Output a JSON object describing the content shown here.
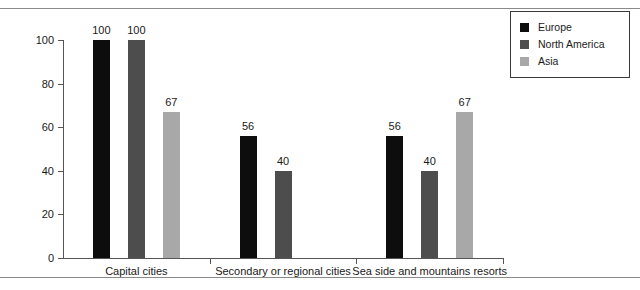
{
  "chart_data": {
    "type": "bar",
    "title": "",
    "subtitle": "",
    "xlabel": "",
    "ylabel": "",
    "ylim": [
      0,
      100
    ],
    "yticks": [
      0,
      20,
      40,
      60,
      80,
      100
    ],
    "grid": false,
    "legend_position": "top-right",
    "categories": [
      "Capital cities",
      "Secondary or regional cities",
      "Sea side and mountains resorts"
    ],
    "series": [
      {
        "name": "Europe",
        "color": "#0d0d0d",
        "values": [
          100,
          56,
          56
        ]
      },
      {
        "name": "North America",
        "color": "#4d4d4d",
        "values": [
          100,
          40,
          40
        ]
      },
      {
        "name": "Asia",
        "color": "#a8a8a8",
        "values": [
          67,
          null,
          67
        ]
      }
    ],
    "data_labels": {
      "Capital cities": [
        "100",
        "100",
        "67"
      ],
      "Secondary or regional cities": [
        "56",
        "40",
        ""
      ],
      "Sea side and mountains resorts": [
        "56",
        "40",
        "67"
      ]
    }
  },
  "legend": {
    "items": [
      {
        "label": "Europe",
        "color": "#0d0d0d"
      },
      {
        "label": "North America",
        "color": "#4d4d4d"
      },
      {
        "label": "Asia",
        "color": "#a8a8a8"
      }
    ]
  },
  "axis": {
    "y_tick_labels": [
      "100",
      "80",
      "60",
      "40",
      "20",
      "0"
    ]
  }
}
